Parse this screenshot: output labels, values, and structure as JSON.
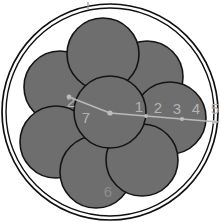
{
  "figure": {
    "title": "",
    "background_color": "#ffffff",
    "circle_fill_color": "#6e6e6e",
    "circle_stroke_color": "#141414",
    "label_color": "#b3b3b3",
    "measure_line_color": "#b9b9b9"
  },
  "outer_boundary": {
    "name": "enclosing-circle",
    "cx": 110,
    "cy": 112,
    "r": 108
  },
  "inner_boundary": {
    "name": "inner-enclosing-circle",
    "cx": 110,
    "cy": 112,
    "r": 104
  },
  "packed_circles": [
    {
      "id": 1,
      "label": "1",
      "cx": 110,
      "cy": 112,
      "r": 36,
      "label_x": 139,
      "label_y": 108
    },
    {
      "id": 2,
      "label": "2",
      "cx": 147,
      "cy": 77,
      "r": 36,
      "label_x": 158,
      "label_y": 109
    },
    {
      "id": 3,
      "label": "3",
      "cx": 170,
      "cy": 118,
      "r": 36,
      "label_x": 177,
      "label_y": 110
    },
    {
      "id": 4,
      "label": "4",
      "cx": 142,
      "cy": 160,
      "r": 36,
      "label_x": 196,
      "label_y": 110
    },
    {
      "id": 5,
      "label": "5",
      "cx": 96,
      "cy": 172,
      "r": 36,
      "label_x": 215,
      "label_y": 110
    },
    {
      "id": 6,
      "label": "6",
      "cx": 56,
      "cy": 142,
      "r": 36,
      "label_x": 108,
      "label_y": 193
    },
    {
      "id": 7,
      "label": "7",
      "cx": 60,
      "cy": 87,
      "r": 36,
      "label_x": 86,
      "label_y": 119
    }
  ],
  "extra_labels": [
    {
      "name": "label-2-upper-left",
      "text": "2",
      "x": 71,
      "y": 103
    }
  ],
  "measure_polyline": {
    "name": "radius-measure-polyline",
    "points": "69,97 110,113 218,122",
    "nodes": [
      {
        "x": 69,
        "y": 97
      },
      {
        "x": 110,
        "y": 113
      },
      {
        "x": 146,
        "y": 116
      },
      {
        "x": 182,
        "y": 119
      },
      {
        "x": 218,
        "y": 122
      }
    ]
  },
  "top_marker": {
    "name": "top-tick-marker",
    "x": 88,
    "y1": 2,
    "y2": 9
  }
}
